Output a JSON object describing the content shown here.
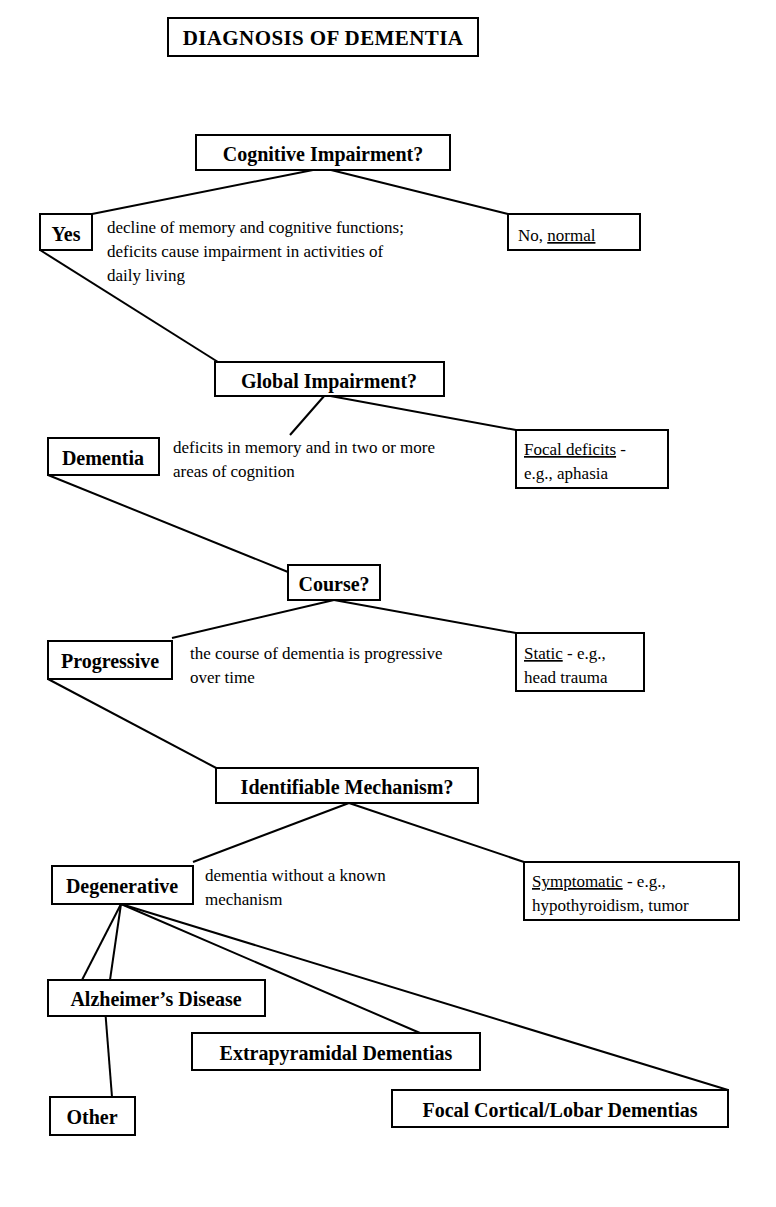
{
  "title": "DIAGNOSIS OF DEMENTIA",
  "decisions": [
    {
      "id": "cognitive-impairment",
      "label": "Cognitive Impairment?"
    },
    {
      "id": "global-impairment",
      "label": "Global Impairment?"
    },
    {
      "id": "course",
      "label": "Course?"
    },
    {
      "id": "identifiable-mechanism",
      "label": "Identifiable Mechanism?"
    }
  ],
  "outcomes": {
    "yes": "Yes",
    "no_normal_prefix": "No, ",
    "no_normal_underlined": "normal",
    "dementia": "Dementia",
    "focal_deficits_underlined": "Focal deficits",
    "focal_deficits_suffix": " -",
    "focal_deficits_line2": "e.g., aphasia",
    "progressive": "Progressive",
    "static_underlined": "Static",
    "static_suffix": " - e.g.,",
    "static_line2": "head trauma",
    "degenerative": "Degenerative",
    "symptomatic_underlined": "Symptomatic",
    "symptomatic_suffix": "  - e.g.,",
    "symptomatic_line2": "hypothyroidism, tumor"
  },
  "notes": {
    "cognitive_line1": "decline of memory and cognitive functions;",
    "cognitive_line2": "deficits cause impairment in activities of",
    "cognitive_line3": "daily living",
    "global_line1": "deficits in memory and in two or more",
    "global_line2": "areas of cognition",
    "course_line1": "the course of dementia is progressive",
    "course_line2": "over time",
    "mechanism_line1": "dementia without a known",
    "mechanism_line2": "mechanism"
  },
  "leaves": [
    {
      "id": "alzheimers-disease",
      "label": "Alzheimer’s Disease"
    },
    {
      "id": "extrapyramidal-dementias",
      "label": "Extrapyramidal Dementias"
    },
    {
      "id": "other",
      "label": "Other"
    },
    {
      "id": "focal-cortical-lobar-dementias",
      "label": "Focal Cortical/Lobar Dementias"
    }
  ],
  "colors": {
    "ink": "#000000",
    "paper": "#ffffff"
  }
}
